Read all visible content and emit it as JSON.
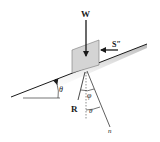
{
  "diagram": {
    "type": "free-body-diagram",
    "labels": {
      "weight": "W",
      "force_s": "S″",
      "reaction": "R",
      "normal": "n",
      "incline_angle": "θ",
      "friction_angle": "φ",
      "normal_angle": "θ"
    },
    "colors": {
      "line": "#1a1a1a",
      "block_fill": "#d4d4d4",
      "block_stroke": "#666666",
      "surface_shade": "#bdbdbd"
    }
  }
}
